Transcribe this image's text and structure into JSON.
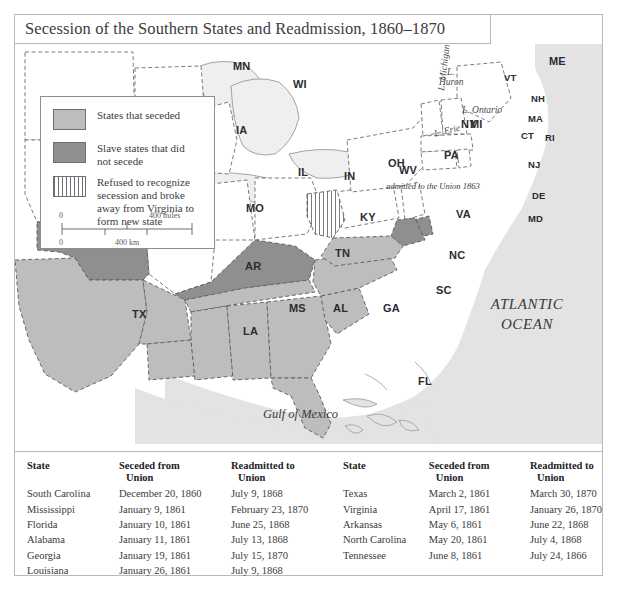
{
  "title": "Secession of the Southern States and Readmission, 1860–1870",
  "legend": {
    "items": [
      {
        "key": "seceded",
        "label": "States that seceded",
        "swatch": "solid-light-gray",
        "color": "#bdbdbd"
      },
      {
        "key": "slave_not_seceded",
        "label": "Slave states that did not secede",
        "swatch": "solid-dark-gray",
        "color": "#8f8f8f"
      },
      {
        "key": "west_virginia",
        "label": "Refused to recognize secession and broke away from Virginia to form new state",
        "swatch": "vertical-hatch",
        "color": "#ffffff"
      }
    ],
    "scale": {
      "miles_zero": "0",
      "miles_max": "400 miles",
      "km_zero": "0",
      "km_mid": "400 km"
    }
  },
  "map": {
    "annotation_wv": "admitted to the Union 1863",
    "oceans": [
      {
        "name": "atlantic",
        "line1": "ATLANTIC",
        "line2": "OCEAN"
      },
      {
        "name": "gulf",
        "label": "Gulf of Mexico"
      }
    ],
    "lakes": [
      {
        "name": "lake-michigan",
        "label": "L. Michigan"
      },
      {
        "name": "lake-huron",
        "line1": "L.",
        "line2": "Huron"
      },
      {
        "name": "lake-erie",
        "label": "L. Erie"
      },
      {
        "name": "lake-ontario",
        "label": "L. Ontario"
      }
    ],
    "states": [
      {
        "code": "MN",
        "status": "union"
      },
      {
        "code": "WI",
        "status": "union"
      },
      {
        "code": "IA",
        "status": "union"
      },
      {
        "code": "IL",
        "status": "union"
      },
      {
        "code": "IN",
        "status": "union"
      },
      {
        "code": "MI",
        "status": "union"
      },
      {
        "code": "OH",
        "status": "union"
      },
      {
        "code": "PA",
        "status": "union"
      },
      {
        "code": "NY",
        "status": "union"
      },
      {
        "code": "ME",
        "status": "union"
      },
      {
        "code": "VT",
        "status": "union"
      },
      {
        "code": "NH",
        "status": "union"
      },
      {
        "code": "MA",
        "status": "union"
      },
      {
        "code": "CT",
        "status": "union"
      },
      {
        "code": "RI",
        "status": "union"
      },
      {
        "code": "NJ",
        "status": "union"
      },
      {
        "code": "DE",
        "status": "slave_not_seceded"
      },
      {
        "code": "MD",
        "status": "slave_not_seceded"
      },
      {
        "code": "MO",
        "status": "slave_not_seceded"
      },
      {
        "code": "KY",
        "status": "slave_not_seceded"
      },
      {
        "code": "WV",
        "status": "west_virginia"
      },
      {
        "code": "VA",
        "status": "seceded"
      },
      {
        "code": "NC",
        "status": "seceded"
      },
      {
        "code": "SC",
        "status": "seceded"
      },
      {
        "code": "GA",
        "status": "seceded"
      },
      {
        "code": "FL",
        "status": "seceded"
      },
      {
        "code": "AL",
        "status": "seceded"
      },
      {
        "code": "MS",
        "status": "seceded"
      },
      {
        "code": "LA",
        "status": "seceded"
      },
      {
        "code": "AR",
        "status": "seceded"
      },
      {
        "code": "TN",
        "status": "seceded"
      },
      {
        "code": "TX",
        "status": "seceded"
      }
    ]
  },
  "tables": {
    "columns": [
      "State",
      "Seceded from Union",
      "Readmitted to Union"
    ],
    "columns_wrapped": [
      {
        "l1": "State",
        "l2": ""
      },
      {
        "l1": "Seceded from",
        "l2": "Union"
      },
      {
        "l1": "Readmitted to",
        "l2": "Union"
      }
    ],
    "left_rows": [
      {
        "state": "South Carolina",
        "seceded": "December 20, 1860",
        "readmitted": "July 9, 1868"
      },
      {
        "state": "Mississippi",
        "seceded": "January 9, 1861",
        "readmitted": "February 23, 1870"
      },
      {
        "state": "Florida",
        "seceded": "January 10, 1861",
        "readmitted": "June 25, 1868"
      },
      {
        "state": "Alabama",
        "seceded": "January 11, 1861",
        "readmitted": "July 13, 1868"
      },
      {
        "state": "Georgia",
        "seceded": "January 19, 1861",
        "readmitted": "July 15, 1870"
      },
      {
        "state": "Louisiana",
        "seceded": "January 26, 1861",
        "readmitted": "July 9, 1868"
      }
    ],
    "right_rows": [
      {
        "state": "Texas",
        "seceded": "March 2, 1861",
        "readmitted": "March 30, 1870"
      },
      {
        "state": "Virginia",
        "seceded": "April 17, 1861",
        "readmitted": "January 26, 1870"
      },
      {
        "state": "Arkansas",
        "seceded": "May 6, 1861",
        "readmitted": "June 22, 1868"
      },
      {
        "state": "North Carolina",
        "seceded": "May 20, 1861",
        "readmitted": "July 4, 1868"
      },
      {
        "state": "Tennessee",
        "seceded": "June 8, 1861",
        "readmitted": "July 24, 1866"
      }
    ]
  },
  "colors": {
    "seceded": "#bdbdbd",
    "slave_not_seceded": "#8f8f8f",
    "union": "#ffffff",
    "ocean": "#e3e3e3",
    "lake": "#efefef",
    "border": "#b9b9bd",
    "text": "#34343a"
  }
}
